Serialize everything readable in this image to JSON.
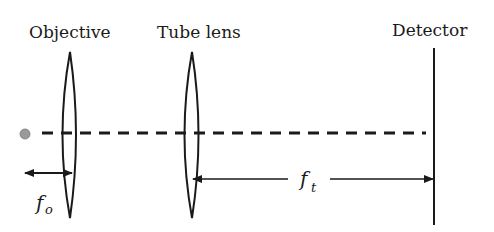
{
  "diagram": {
    "labels": {
      "objective": "Objective",
      "tube_lens": "Tube lens",
      "detector": "Detector"
    },
    "focal_lengths": {
      "objective": {
        "symbol": "f",
        "subscript": "o"
      },
      "tube": {
        "symbol": "f",
        "subscript": "t"
      }
    },
    "colors": {
      "ink": "#1a1a1a",
      "source_dot": "#9a9a9a"
    }
  }
}
